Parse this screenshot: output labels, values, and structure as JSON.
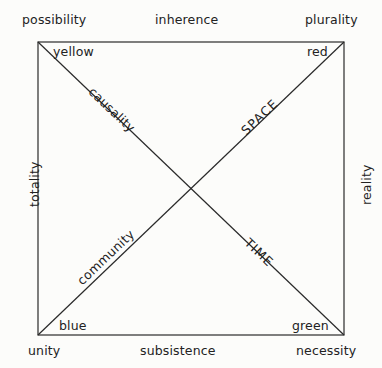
{
  "figure": {
    "background_color": "#fcfcfa",
    "line_color": "#2a2a2a",
    "text_color": "#222222",
    "square": {
      "x": 38,
      "y": 42,
      "width": 306,
      "height": 293
    },
    "center": {
      "x": 191,
      "y": 188
    }
  },
  "outer_labels": {
    "top_left": "possibility",
    "top_center": "inherence",
    "top_right": "plurality",
    "left_middle": "totality",
    "right_middle": "reality",
    "bottom_left": "unity",
    "bottom_center": "subsistence",
    "bottom_right": "necessity"
  },
  "corner_labels": {
    "top_left": "yellow",
    "top_right": "red",
    "bottom_left": "blue",
    "bottom_right": "green"
  },
  "diagonal_labels": {
    "upper_left_descending": "causality",
    "upper_right_ascending": "SPACE",
    "lower_left_ascending": "community",
    "lower_right_descending": "TIME"
  }
}
